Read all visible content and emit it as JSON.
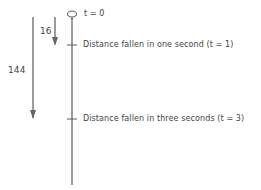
{
  "diagram": {
    "start_label": "t = 0",
    "markers": [
      {
        "label": "Distance fallen in one second (t = 1)",
        "t": 1
      },
      {
        "label": "Distance fallen in three seconds (t = 3)",
        "t": 3
      }
    ],
    "arrows": [
      {
        "value": "16",
        "meaning": "distance after 1 s"
      },
      {
        "value": "144",
        "meaning": "distance after 3 s"
      }
    ],
    "colors": {
      "line": "#666666",
      "text": "#444444"
    }
  }
}
